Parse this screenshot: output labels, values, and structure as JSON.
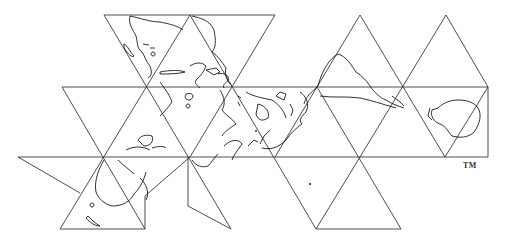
{
  "map": {
    "title": "Dymaxion Map",
    "projection": "icosahedral (Fuller projection)",
    "trademark": "TM",
    "line_color": "#3a3a3a",
    "coast_color": "#1a1a1a",
    "background": "#ffffff"
  }
}
